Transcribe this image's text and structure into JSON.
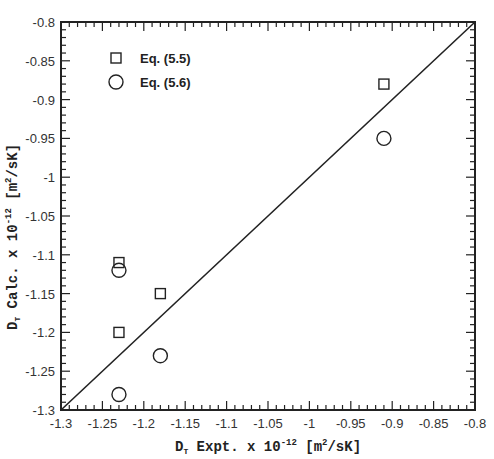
{
  "chart_data": {
    "type": "scatter",
    "title": "",
    "xlabel": "D_T Expt. x 10^-12 [m^2/sK]",
    "ylabel": "D_T Calc. x 10^-12 [m^2/sK]",
    "xlim": [
      -1.3,
      -0.8
    ],
    "ylim": [
      -1.3,
      -0.8
    ],
    "x_ticks": [
      "-1.3",
      "-1.25",
      "-1.2",
      "-1.15",
      "-1.1",
      "-1.05",
      "-1",
      "-0.95",
      "-0.9",
      "-0.85",
      "-0.8"
    ],
    "y_ticks": [
      "-1.3",
      "-1.25",
      "-1.2",
      "-1.15",
      "-1.1",
      "-1.05",
      "-1",
      "-0.95",
      "-0.9",
      "-0.85",
      "-0.8"
    ],
    "grid": false,
    "legend_position": "upper-left",
    "series": [
      {
        "name": "Eq. (5.5)",
        "marker": "square",
        "x": [
          -1.23,
          -1.18,
          -1.23,
          -0.91
        ],
        "y": [
          -1.11,
          -1.15,
          -1.2,
          -0.88
        ]
      },
      {
        "name": "Eq. (5.6)",
        "marker": "circle",
        "x": [
          -1.23,
          -1.18,
          -1.23,
          -0.91
        ],
        "y": [
          -1.12,
          -1.23,
          -1.28,
          -0.95
        ]
      }
    ],
    "reference_line": {
      "name": "y = x",
      "x": [
        -1.3,
        -0.8
      ],
      "y": [
        -1.3,
        -0.8
      ]
    }
  },
  "axes": {
    "xlabel_main": "D",
    "xlabel_sub": "T",
    "xlabel_rest": " Expt. x 10",
    "xlabel_exp": "-12",
    "xlabel_unit": " [m",
    "xlabel_unit_exp": "2",
    "xlabel_unit_end": "/sK]",
    "ylabel_main": "D",
    "ylabel_sub": "T",
    "ylabel_rest": " Calc. x 10",
    "ylabel_exp": "-12",
    "ylabel_unit": " [m",
    "ylabel_unit_exp": "2",
    "ylabel_unit_end": "/sK]"
  },
  "legend": {
    "items": [
      {
        "label": "Eq. (5.5)",
        "marker": "square"
      },
      {
        "label": "Eq. (5.6)",
        "marker": "circle"
      }
    ]
  }
}
